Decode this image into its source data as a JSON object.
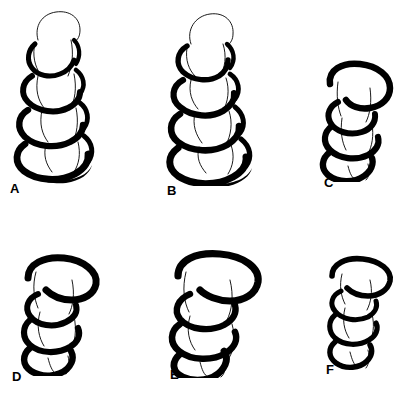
{
  "figure": {
    "background_color": "#ffffff",
    "ink_color": "#000000",
    "width": 408,
    "height": 399,
    "rows": 2,
    "columns": 3
  },
  "panels": [
    {
      "label": "A",
      "name": "panel-a",
      "description": "Upright alpha-helix ribbon, full length, viewed side-on with rounded cap at top",
      "turns": 5,
      "orientation": "vertical",
      "tilt_degrees": 0,
      "label_x": 10,
      "label_y": 182,
      "box_x": 10,
      "box_y": 6,
      "box_w": 110,
      "box_h": 175
    },
    {
      "label": "B",
      "name": "panel-b",
      "description": "Upright alpha-helix ribbon, slightly rotated about vertical axis showing deeper coil grooves",
      "turns": 5,
      "orientation": "vertical",
      "tilt_degrees": 0,
      "label_x": 170,
      "label_y": 184,
      "box_x": 165,
      "box_y": 6,
      "box_w": 110,
      "box_h": 178
    },
    {
      "label": "C",
      "name": "panel-c",
      "description": "Alpha-helix ribbon foreshortened, tilted toward viewer, broad flattened turns",
      "turns": 4,
      "orientation": "tilted",
      "tilt_degrees": 25,
      "label_x": 326,
      "label_y": 179,
      "box_x": 310,
      "box_y": 58,
      "box_w": 95,
      "box_h": 122
    },
    {
      "label": "D",
      "name": "panel-d",
      "description": "Alpha-helix ribbon viewed obliquely from above, wide sweeping top turn",
      "turns": 4,
      "orientation": "tilted",
      "tilt_degrees": 30,
      "label_x": 12,
      "label_y": 372,
      "box_x": 14,
      "box_y": 252,
      "box_w": 100,
      "box_h": 122
    },
    {
      "label": "E",
      "name": "panel-e",
      "description": "Alpha-helix ribbon viewed obliquely, largest of the lower row, broad overlapping turns",
      "turns": 4,
      "orientation": "tilted",
      "tilt_degrees": 28,
      "label_x": 170,
      "label_y": 372,
      "box_x": 160,
      "box_y": 248,
      "box_w": 118,
      "box_h": 128
    },
    {
      "label": "F",
      "name": "panel-f",
      "description": "Alpha-helix ribbon, narrow oblique view, compact stacked turns",
      "turns": 4,
      "orientation": "tilted",
      "tilt_degrees": 20,
      "label_x": 326,
      "label_y": 369,
      "box_x": 320,
      "box_y": 252,
      "box_w": 82,
      "box_h": 118
    }
  ]
}
